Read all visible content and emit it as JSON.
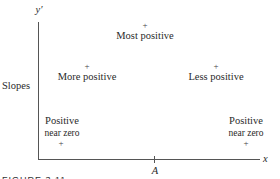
{
  "axes": {
    "y_label": "y′",
    "x_label": "x",
    "side_label": "Slopes",
    "x_tick_label": "A"
  },
  "points": [
    {
      "label": "Most positive",
      "marker": "+"
    },
    {
      "label": "More positive",
      "marker": "+"
    },
    {
      "label": "Less positive",
      "marker": "+"
    },
    {
      "label_line1": "Positive",
      "label_line2": "near zero",
      "marker": "+"
    },
    {
      "label_line1": "Positive",
      "label_line2": "near zero",
      "marker": "+"
    }
  ],
  "caption": "FIGURE 3.11"
}
